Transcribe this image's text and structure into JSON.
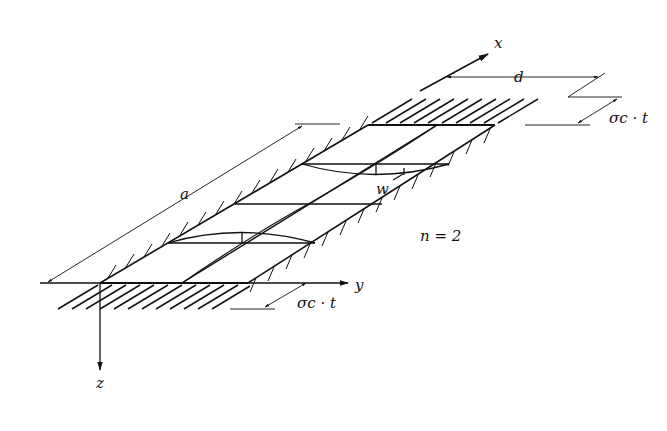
{
  "diagram": {
    "axes": {
      "x": "x",
      "y": "y",
      "z": "z"
    },
    "dimensions": {
      "length": "a",
      "width": "d"
    },
    "loads": {
      "top": "σc · t",
      "bottom": "σc · t"
    },
    "deflection_label": "w",
    "mode_label": "n = 2",
    "colors": {
      "line": "#111111",
      "background": "#ffffff"
    }
  }
}
